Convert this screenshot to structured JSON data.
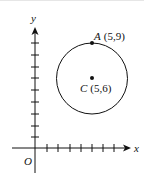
{
  "diagram": {
    "axes": {
      "x_label": "x",
      "y_label": "y",
      "origin_label": "O",
      "x_ticks": 7,
      "y_ticks": 9
    },
    "points": [
      {
        "name": "A",
        "coords": "(5,9)",
        "x": 5,
        "y": 9
      },
      {
        "name": "C",
        "coords": "(5,6)",
        "x": 5,
        "y": 6
      }
    ],
    "circle": {
      "center": "C",
      "center_xy": [
        5,
        6
      ],
      "radius": 3,
      "passes_through": "A"
    },
    "colors": {
      "stroke": "#111111",
      "background": "#ffffff"
    }
  }
}
